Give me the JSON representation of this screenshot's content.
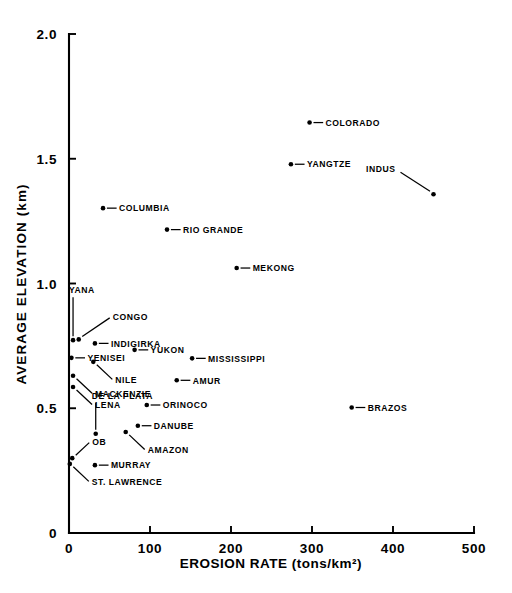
{
  "chart_data": {
    "type": "scatter",
    "title": "",
    "xlabel": "EROSION RATE (tons/km²)",
    "ylabel": "AVERAGE ELEVATION (km)",
    "xlim": [
      0,
      500
    ],
    "ylim": [
      0,
      2.0
    ],
    "grid": false,
    "legend": "none",
    "xticks": [
      "0",
      "100",
      "200",
      "300",
      "400",
      "500"
    ],
    "xtick_values": [
      0,
      100,
      200,
      300,
      400,
      500
    ],
    "yticks": [
      "0",
      "0.5",
      "1.0",
      "1.5",
      "2.0"
    ],
    "ytick_values": [
      0,
      0.5,
      1.0,
      1.5,
      2.0
    ],
    "points": [
      {
        "label": "COLORADO",
        "x": 297,
        "y": 1.645,
        "label_side": "right",
        "leader": "horizontal"
      },
      {
        "label": "YANGTZE",
        "x": 274,
        "y": 1.478,
        "label_side": "right",
        "leader": "horizontal"
      },
      {
        "label": "INDUS",
        "x": 450,
        "y": 1.358,
        "label_side": "upper-left",
        "leader": "diagonal"
      },
      {
        "label": "COLUMBIA",
        "x": 42,
        "y": 1.302,
        "label_side": "right",
        "leader": "horizontal"
      },
      {
        "label": "RIO GRANDE",
        "x": 121,
        "y": 1.216,
        "label_side": "right",
        "leader": "horizontal"
      },
      {
        "label": "MEKONG",
        "x": 207,
        "y": 1.062,
        "label_side": "right",
        "leader": "horizontal"
      },
      {
        "label": "YANA",
        "x": 5,
        "y": 0.773,
        "label_side": "above",
        "leader": "vertical"
      },
      {
        "label": "CONGO",
        "x": 12,
        "y": 0.776,
        "label_side": "upper-right",
        "leader": "diagonal"
      },
      {
        "label": "INDIGIRKA",
        "x": 32,
        "y": 0.76,
        "label_side": "right",
        "leader": "horizontal"
      },
      {
        "label": "YUKON",
        "x": 81,
        "y": 0.734,
        "label_side": "right",
        "leader": "horizontal"
      },
      {
        "label": "MISSISSIPPI",
        "x": 152,
        "y": 0.7,
        "label_side": "right",
        "leader": "horizontal"
      },
      {
        "label": "YENISEI",
        "x": 3,
        "y": 0.702,
        "label_side": "right",
        "leader": "horizontal"
      },
      {
        "label": "NILE",
        "x": 30,
        "y": 0.686,
        "label_side": "lower-right",
        "leader": "diagonal"
      },
      {
        "label": "AMUR",
        "x": 133,
        "y": 0.612,
        "label_side": "right",
        "leader": "horizontal"
      },
      {
        "label": "MACKENZIE",
        "x": 5,
        "y": 0.63,
        "label_side": "lower-right",
        "leader": "diagonal"
      },
      {
        "label": "LENA",
        "x": 5,
        "y": 0.585,
        "label_side": "lower-right",
        "leader": "diagonal"
      },
      {
        "label": "ORINOCO",
        "x": 96,
        "y": 0.513,
        "label_side": "right",
        "leader": "horizontal"
      },
      {
        "label": "DE LA PLATA",
        "x": 33,
        "y": 0.398,
        "label_side": "above",
        "leader": "vertical"
      },
      {
        "label": "DANUBE",
        "x": 85,
        "y": 0.43,
        "label_side": "right",
        "leader": "horizontal"
      },
      {
        "label": "AMAZON",
        "x": 70,
        "y": 0.405,
        "label_side": "lower-right",
        "leader": "diagonal"
      },
      {
        "label": "BRAZOS",
        "x": 349,
        "y": 0.503,
        "label_side": "right",
        "leader": "horizontal"
      },
      {
        "label": "OB",
        "x": 4,
        "y": 0.3,
        "label_side": "upper-right",
        "leader": "diagonal"
      },
      {
        "label": "MURRAY",
        "x": 32,
        "y": 0.272,
        "label_side": "right",
        "leader": "horizontal"
      },
      {
        "label": "ST. LAWRENCE",
        "x": 1,
        "y": 0.277,
        "label_side": "lower-right",
        "leader": "diagonal"
      }
    ]
  }
}
